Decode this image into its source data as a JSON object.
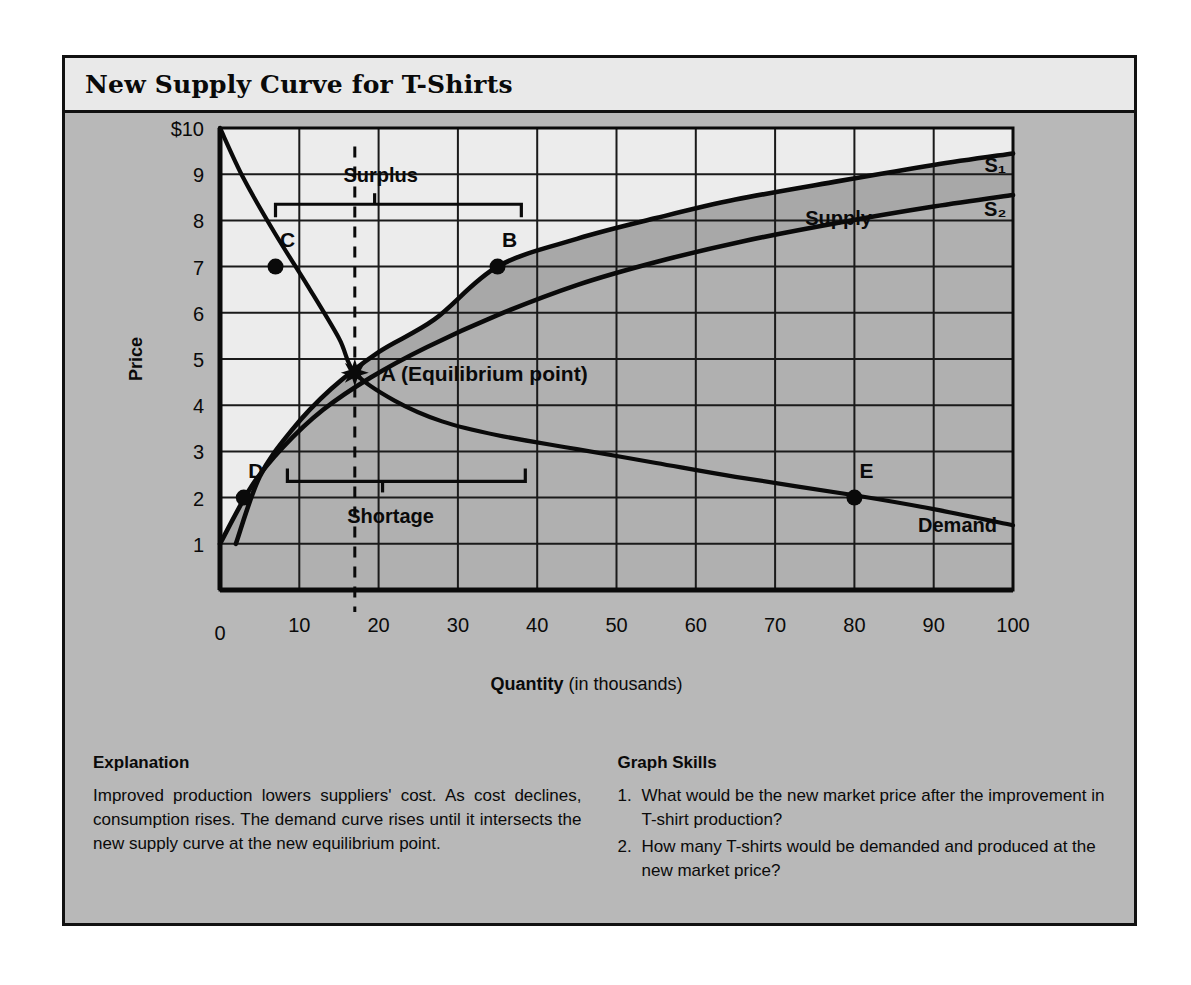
{
  "figure": {
    "title": "New Supply Curve for T-Shirts"
  },
  "explanation": {
    "heading": "Explanation",
    "body": "Improved production lowers suppliers' cost. As cost declines, consumption rises. The demand curve rises until it intersects the new supply curve at the new equilibrium point."
  },
  "graph_skills": {
    "heading": "Graph Skills",
    "items": [
      {
        "num": "1.",
        "text": "What would be the new market price after the improvement in T-shirt production?"
      },
      {
        "num": "2.",
        "text": "How many T-shirts would be demanded and produced at the new market price?"
      }
    ]
  },
  "chart_data": {
    "type": "line",
    "title": "New Supply Curve for T-Shirts",
    "xlabel": "Quantity",
    "xlabel_suffix": "(in thousands)",
    "ylabel": "Price",
    "xlim": [
      0,
      100
    ],
    "ylim": [
      0,
      10
    ],
    "grid": true,
    "x_ticks": [
      0,
      10,
      20,
      30,
      40,
      50,
      60,
      70,
      80,
      90,
      100
    ],
    "x_tick_labels": [
      "0",
      "10",
      "20",
      "30",
      "40",
      "50",
      "60",
      "70",
      "80",
      "90",
      "100"
    ],
    "y_ticks": [
      1,
      2,
      3,
      4,
      5,
      6,
      7,
      8,
      9,
      10
    ],
    "y_tick_labels": [
      "1",
      "2",
      "3",
      "4",
      "5",
      "6",
      "7",
      "8",
      "9",
      "$10"
    ],
    "series": [
      {
        "name": "S1",
        "label": "S₁",
        "role": "original-supply",
        "points": [
          [
            2,
            1
          ],
          [
            5,
            2.45
          ],
          [
            9,
            3.45
          ],
          [
            14,
            4.35
          ],
          [
            20,
            5.15
          ],
          [
            27,
            5.85
          ],
          [
            35,
            7.0
          ],
          [
            45,
            7.6
          ],
          [
            55,
            8.05
          ],
          [
            65,
            8.45
          ],
          [
            78,
            8.85
          ],
          [
            90,
            9.2
          ],
          [
            100,
            9.45
          ]
        ]
      },
      {
        "name": "S2",
        "label": "S₂",
        "role": "new-supply",
        "points": [
          [
            0,
            1
          ],
          [
            4,
            2.25
          ],
          [
            8,
            3.1
          ],
          [
            13,
            3.9
          ],
          [
            19,
            4.6
          ],
          [
            26,
            5.25
          ],
          [
            35,
            5.95
          ],
          [
            45,
            6.6
          ],
          [
            55,
            7.1
          ],
          [
            66,
            7.55
          ],
          [
            78,
            7.95
          ],
          [
            90,
            8.3
          ],
          [
            100,
            8.55
          ]
        ]
      },
      {
        "name": "Demand",
        "label": "Demand",
        "role": "demand",
        "points": [
          [
            0,
            10
          ],
          [
            3,
            8.9
          ],
          [
            7,
            7.7
          ],
          [
            11,
            6.6
          ],
          [
            15,
            5.45
          ],
          [
            17,
            4.7
          ],
          [
            22,
            4.1
          ],
          [
            28,
            3.65
          ],
          [
            35,
            3.35
          ],
          [
            45,
            3.05
          ],
          [
            55,
            2.75
          ],
          [
            65,
            2.45
          ],
          [
            80,
            2.05
          ],
          [
            90,
            1.75
          ],
          [
            100,
            1.4
          ]
        ]
      }
    ],
    "points": [
      {
        "label": "A",
        "caption": "A (Equilibrium point)",
        "x": 17,
        "y": 4.7,
        "marker": "star"
      },
      {
        "label": "B",
        "x": 35,
        "y": 7,
        "marker": "dot"
      },
      {
        "label": "C",
        "x": 7,
        "y": 7,
        "marker": "dot"
      },
      {
        "label": "D",
        "x": 3,
        "y": 2,
        "marker": "dot"
      },
      {
        "label": "E",
        "x": 80,
        "y": 2,
        "marker": "dot"
      }
    ],
    "annotations": [
      {
        "label": "Surplus",
        "type": "bracket",
        "orient": "up",
        "x_start": 7,
        "y": 8.35,
        "x_end": 38,
        "x_center": 19.5
      },
      {
        "label": "Shortage",
        "type": "bracket",
        "orient": "down",
        "x_start": 8.5,
        "y": 2.35,
        "x_end": 38.5,
        "x_center": 20.5
      },
      {
        "label": "Supply",
        "type": "curve-label",
        "x": 78,
        "y": 7.9
      }
    ],
    "equilibrium_line": {
      "x": 17,
      "y_from": 0,
      "y_to": 9.6,
      "style": "dashed"
    },
    "colors": {
      "panel_background": "#b8b8b8",
      "title_background": "#e9e9e9",
      "plot_upper_fill": "#ececec",
      "plot_lower_fill": "#b0b0b0",
      "band_fill": "#a8a8a8",
      "line": "#0a0a0a",
      "grid": "#1a1a1a"
    }
  }
}
